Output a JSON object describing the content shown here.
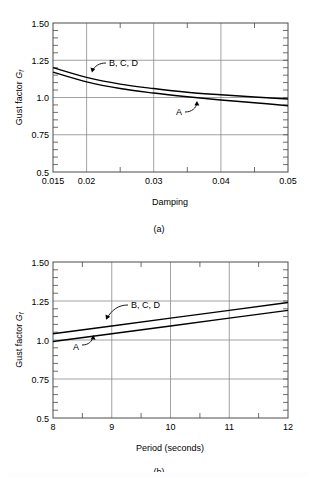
{
  "figure": {
    "panels": [
      {
        "id": "a",
        "caption": "(a)",
        "x_axis_title": "Damping",
        "y_axis_title_main": "Gust factor ",
        "y_axis_title_symbol": "G",
        "y_axis_title_subscript": "f",
        "x_tick_labels": [
          "0.015",
          "0.02",
          "0.03",
          "0.04",
          "0.05"
        ],
        "y_tick_labels": [
          "1.50",
          "1.25",
          "1.0",
          "0.75",
          "0.5"
        ],
        "curve_label_upper": "B, C, D",
        "curve_label_lower": "A"
      },
      {
        "id": "b",
        "caption": "(b)",
        "x_axis_title": "Period (seconds)",
        "y_axis_title_main": "Gust factor ",
        "y_axis_title_symbol": "G",
        "y_axis_title_subscript": "f",
        "x_tick_labels": [
          "8",
          "9",
          "10",
          "11",
          "12"
        ],
        "y_tick_labels": [
          "1.50",
          "1.25",
          "1.0",
          "0.75",
          "0.5"
        ],
        "curve_label_upper": "B, C, D",
        "curve_label_lower": "A"
      }
    ]
  },
  "chart_data": [
    {
      "type": "line",
      "id": "a",
      "title": "",
      "xlabel": "Damping",
      "ylabel": "Gust factor Gf",
      "xlim": [
        0.015,
        0.05
      ],
      "ylim": [
        0.5,
        1.5
      ],
      "xticks": [
        0.015,
        0.02,
        0.03,
        0.04,
        0.05
      ],
      "yticks": [
        0.5,
        0.75,
        1.0,
        1.25,
        1.5
      ],
      "xtick_labels": [
        "0.015",
        "0.02",
        "0.03",
        "0.04",
        "0.05"
      ],
      "ytick_labels": [
        "0.5",
        "0.75",
        "1.0",
        "1.25",
        "1.50"
      ],
      "grid": true,
      "grid_axes": "both",
      "legend": "inline-annotations",
      "annotations": [
        {
          "text": "B, C, D",
          "points_to_series": "B, C, D"
        },
        {
          "text": "A",
          "points_to_series": "A"
        }
      ],
      "x": [
        0.015,
        0.02,
        0.025,
        0.03,
        0.035,
        0.04,
        0.045,
        0.05
      ],
      "series": [
        {
          "name": "B, C, D",
          "values": [
            1.2,
            1.135,
            1.09,
            1.06,
            1.035,
            1.018,
            1.003,
            0.99
          ]
        },
        {
          "name": "A",
          "values": [
            1.17,
            1.105,
            1.06,
            1.03,
            1.005,
            0.983,
            0.965,
            0.945
          ]
        }
      ]
    },
    {
      "type": "line",
      "id": "b",
      "title": "",
      "xlabel": "Period (seconds)",
      "ylabel": "Gust factor Gf",
      "xlim": [
        8,
        12
      ],
      "ylim": [
        0.5,
        1.5
      ],
      "xticks": [
        8,
        9,
        10,
        11,
        12
      ],
      "yticks": [
        0.5,
        0.75,
        1.0,
        1.25,
        1.5
      ],
      "xtick_labels": [
        "8",
        "9",
        "10",
        "11",
        "12"
      ],
      "ytick_labels": [
        "0.5",
        "0.75",
        "1.0",
        "1.25",
        "1.50"
      ],
      "grid": true,
      "grid_axes": "both",
      "legend": "inline-annotations",
      "annotations": [
        {
          "text": "B, C, D",
          "points_to_series": "B, C, D"
        },
        {
          "text": "A",
          "points_to_series": "A"
        }
      ],
      "x": [
        8,
        9,
        10,
        11,
        12
      ],
      "series": [
        {
          "name": "B, C, D",
          "values": [
            1.04,
            1.09,
            1.14,
            1.19,
            1.24
          ]
        },
        {
          "name": "A",
          "values": [
            0.99,
            1.04,
            1.09,
            1.14,
            1.19
          ]
        }
      ]
    }
  ]
}
